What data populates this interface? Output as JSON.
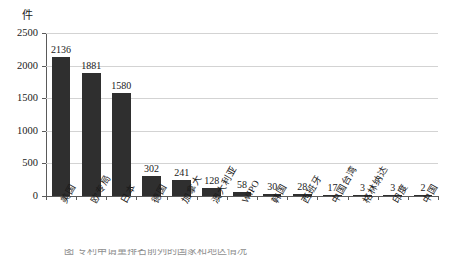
{
  "chart_data": {
    "type": "bar",
    "title": "",
    "subtitle": "",
    "xlabel": "",
    "ylabel": "件",
    "unit_label": "件",
    "ylim": [
      0,
      2500
    ],
    "yticks": [
      0,
      500,
      1000,
      1500,
      2000,
      2500
    ],
    "ytick_labels": [
      "0",
      "500",
      "1000",
      "1500",
      "2000",
      "2500"
    ],
    "grid": true,
    "grid_axis": "y",
    "legend": false,
    "legend_position": "none",
    "bar_color": "#2f2f2f",
    "grid_color": "#d3d3d3",
    "axis_color": "#5a5a5a",
    "categories": [
      "美国",
      "欧专局",
      "日本",
      "德国",
      "加拿大",
      "澳大利亚",
      "WIPO",
      "韩国",
      "西班牙",
      "中国台湾",
      "格林纳达",
      "印度",
      "中国"
    ],
    "values": [
      2136,
      1881,
      1580,
      302,
      241,
      128,
      58,
      30,
      28,
      17,
      3,
      3,
      2
    ],
    "data_labels": [
      "2136",
      "1881",
      "1580",
      "302",
      "241",
      "128",
      "58",
      "30",
      "28",
      "17",
      "3",
      "3",
      "2"
    ]
  },
  "caption": {
    "text": "图 专利申请量排名前列的国家和地区情况"
  }
}
